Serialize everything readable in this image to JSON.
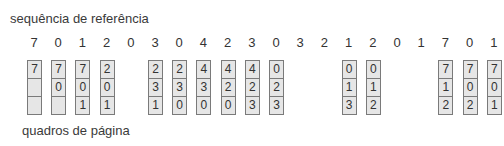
{
  "labels": {
    "reference_string": "sequência de referência",
    "page_frames": "quadros de página"
  },
  "reference_string": [
    "7",
    "0",
    "1",
    "2",
    "0",
    "3",
    "0",
    "4",
    "2",
    "3",
    "0",
    "3",
    "2",
    "1",
    "2",
    "0",
    "1",
    "7",
    "0",
    "1"
  ],
  "frames": [
    {
      "ref_index": 0,
      "cells": [
        "7",
        "",
        ""
      ]
    },
    {
      "ref_index": 1,
      "cells": [
        "7",
        "0",
        ""
      ]
    },
    {
      "ref_index": 2,
      "cells": [
        "7",
        "0",
        "1"
      ]
    },
    {
      "ref_index": 3,
      "cells": [
        "2",
        "0",
        "1"
      ]
    },
    {
      "ref_index": 5,
      "cells": [
        "2",
        "3",
        "1"
      ]
    },
    {
      "ref_index": 6,
      "cells": [
        "2",
        "3",
        "0"
      ]
    },
    {
      "ref_index": 7,
      "cells": [
        "4",
        "3",
        "0"
      ]
    },
    {
      "ref_index": 8,
      "cells": [
        "4",
        "2",
        "0"
      ]
    },
    {
      "ref_index": 9,
      "cells": [
        "4",
        "2",
        "3"
      ]
    },
    {
      "ref_index": 10,
      "cells": [
        "0",
        "2",
        "3"
      ]
    },
    {
      "ref_index": 13,
      "cells": [
        "0",
        "1",
        "3"
      ]
    },
    {
      "ref_index": 14,
      "cells": [
        "0",
        "1",
        "2"
      ]
    },
    {
      "ref_index": 17,
      "cells": [
        "7",
        "1",
        "2"
      ]
    },
    {
      "ref_index": 18,
      "cells": [
        "7",
        "0",
        "2"
      ]
    },
    {
      "ref_index": 19,
      "cells": [
        "7",
        "0",
        "1"
      ]
    }
  ]
}
